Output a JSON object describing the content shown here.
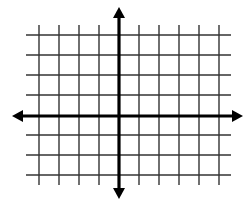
{
  "diagram": {
    "type": "coordinate-plane",
    "title": "",
    "colors": {
      "background": "#ffffff",
      "grid": "#333333",
      "axes": "#000000"
    },
    "grid": {
      "vertical_lines_x": [
        39,
        59,
        79,
        99,
        139,
        159,
        179,
        199,
        219
      ],
      "horizontal_lines_y": [
        35,
        55,
        75,
        95,
        135,
        155,
        175
      ],
      "x_extent": [
        26,
        231
      ],
      "y_extent": [
        25,
        185
      ],
      "stroke_width": 1.4
    },
    "axes": {
      "x_axis": {
        "y": 116,
        "from": 12,
        "to": 243,
        "arrows": "both"
      },
      "y_axis": {
        "x": 119,
        "from": 7,
        "to": 199,
        "arrows": "both"
      },
      "stroke_width": 3.2,
      "labels": []
    }
  }
}
